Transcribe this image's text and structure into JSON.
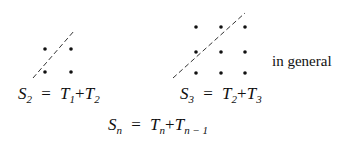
{
  "diagram": {
    "left_figure": {
      "dots": [
        [
          45,
          49
        ],
        [
          71,
          49
        ],
        [
          45,
          72
        ],
        [
          71,
          72
        ]
      ],
      "dashed_line": [
        33,
        78,
        74,
        31
      ],
      "formula": {
        "lhs": "S",
        "lhs_sub": "2",
        "t1": "T",
        "t1_sub": "1",
        "t2": "T",
        "t2_sub": "2",
        "eq": "=",
        "plus": "+"
      }
    },
    "right_figure": {
      "dots": [
        [
          196,
          27
        ],
        [
          221,
          27
        ],
        [
          245,
          27
        ],
        [
          196,
          52
        ],
        [
          221,
          52
        ],
        [
          245,
          52
        ],
        [
          196,
          73
        ],
        [
          221,
          73
        ],
        [
          245,
          73
        ]
      ],
      "dashed_line": [
        173,
        78,
        245,
        13
      ],
      "formula": {
        "lhs": "S",
        "lhs_sub": "3",
        "t1": "T",
        "t1_sub": "2",
        "t2": "T",
        "t2_sub": "3",
        "eq": "=",
        "plus": "+"
      }
    },
    "general_label": "in general",
    "general_formula": {
      "lhs": "S",
      "lhs_sub": "n",
      "t1": "T",
      "t1_sub": "n",
      "t2": "T",
      "t2_sub": "n − 1",
      "eq": "=",
      "plus": "+"
    }
  }
}
